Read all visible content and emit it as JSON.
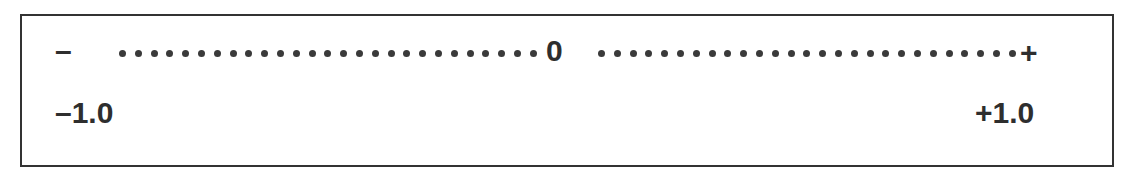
{
  "scale": {
    "negative_symbol": "–",
    "center_symbol": "0",
    "positive_symbol": "+",
    "min_label": "–1.0",
    "max_label": "+1.0",
    "left_dots": 27,
    "right_dots": 27
  },
  "colors": {
    "ink": "#2e2e2e",
    "border": "#333333",
    "background": "#ffffff"
  }
}
